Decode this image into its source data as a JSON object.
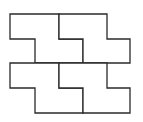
{
  "diagram": {
    "type": "tessellation",
    "stroke_color": "#2a2a2a",
    "fill_color": "#ffffff",
    "tiles": [
      {
        "id": "tile-top-left",
        "points": "10,14 59,14 59,39 83,39 83,63 35,63 35,39 10,39"
      },
      {
        "id": "tile-top-right",
        "points": "59,14 107,14 107,39 130,39 130,63 83,63 83,39 59,39"
      },
      {
        "id": "tile-bottom-left",
        "points": "10,63 59,63 59,88 83,88 83,113 35,113 35,88 10,88"
      },
      {
        "id": "tile-bottom-right",
        "points": "59,63 107,63 107,88 130,88 130,113 83,113 83,88 59,88"
      }
    ]
  }
}
